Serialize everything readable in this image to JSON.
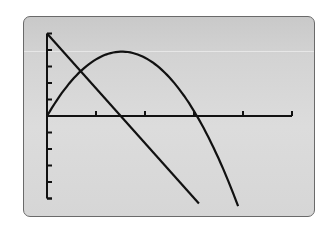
{
  "device": "graphing-calculator-screen",
  "colors": {
    "screen_top": "#c9c9c9",
    "screen_bottom": "#d6d6d6",
    "ink": "#111111",
    "border": "#6a6a6a"
  },
  "window": {
    "xmin": 0,
    "xmax": 5,
    "xscl": 1,
    "ymin": -5,
    "ymax": 5,
    "yscl": 1
  },
  "chart_data": {
    "type": "line",
    "title": "",
    "xlabel": "",
    "ylabel": "",
    "xlim": [
      0,
      5
    ],
    "ylim": [
      -5,
      5
    ],
    "grid": false,
    "x_ticks": [
      1,
      2,
      3,
      4,
      5
    ],
    "y_ticks": [
      -5,
      -4,
      -3,
      -2,
      -1,
      1,
      2,
      3,
      4,
      5
    ],
    "series": [
      {
        "name": "line",
        "kind": "linear",
        "equation": "y = 5 - 3.33x",
        "x": [
          0,
          1.5,
          3.1
        ],
        "y": [
          5,
          0,
          -5.3
        ]
      },
      {
        "name": "parabola",
        "kind": "quadratic",
        "equation": "y = -1.67x(x - 3.06)",
        "x": [
          0,
          0.5,
          1.0,
          1.53,
          2.0,
          2.5,
          3.06,
          3.5,
          3.9
        ],
        "y": [
          0,
          2.13,
          3.43,
          3.9,
          3.53,
          2.33,
          0,
          -2.57,
          -5.46
        ]
      }
    ],
    "intersections": [
      {
        "x": 0.69,
        "y": 2.7
      }
    ],
    "legend": null
  }
}
